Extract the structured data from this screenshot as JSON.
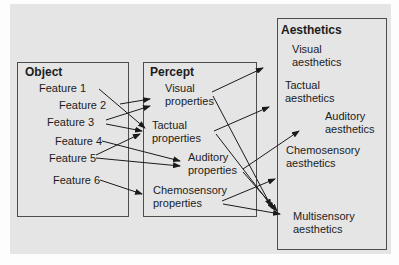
{
  "figure": {
    "panel_bg": "#e5e5e5",
    "box_border": "#4d4d4d",
    "line_color": "#1a1a1a"
  },
  "boxes": {
    "object": {
      "title": "Object",
      "features": [
        "Feature 1",
        "Feature 2",
        "Feature 3",
        "Feature 4",
        "Feature 5",
        "Feature 6"
      ]
    },
    "percept": {
      "title": "Percept",
      "items": [
        "Visual\nproperties",
        "Tactual\nproperties",
        "Auditory\nproperties",
        "Chemosensory\nproperties"
      ]
    },
    "aesthetics": {
      "title": "Aesthetics",
      "items": [
        "Visual\naesthetics",
        "Tactual\naesthetics",
        "Auditory\naesthetics",
        "Chemosensory\naesthetics",
        "Multisensory\naesthetics"
      ]
    }
  },
  "arrows": [
    [
      99,
      89,
      145,
      128
    ],
    [
      120,
      104,
      150,
      99
    ],
    [
      106,
      120,
      150,
      106
    ],
    [
      106,
      124,
      142,
      131
    ],
    [
      96,
      155,
      140,
      134
    ],
    [
      102,
      141,
      180,
      161
    ],
    [
      96,
      158,
      180,
      166
    ],
    [
      100,
      180,
      142,
      194
    ],
    [
      212,
      92,
      263,
      68
    ],
    [
      213,
      96,
      271,
      206
    ],
    [
      214,
      131,
      269,
      107
    ],
    [
      216,
      134,
      274,
      209
    ],
    [
      243,
      169,
      299,
      131
    ],
    [
      243,
      172,
      277,
      211
    ],
    [
      222,
      201,
      275,
      179
    ],
    [
      223,
      204,
      280,
      214
    ]
  ]
}
